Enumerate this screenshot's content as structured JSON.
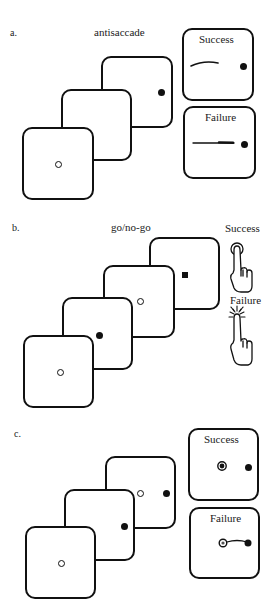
{
  "figure": {
    "panels": [
      {
        "letter": "a.",
        "title": "antisaccade",
        "trial_frames": [
          {
            "stimulus": "hollow-circle-center"
          },
          {
            "stimulus": "blank"
          },
          {
            "stimulus": "filled-dot-right"
          }
        ],
        "outcomes": {
          "success_label": "Success",
          "failure_label": "Failure",
          "success_depiction": "eye trace moves away from target (leftward curve)",
          "failure_depiction": "eye trace moves toward target dot"
        }
      },
      {
        "letter": "b.",
        "title": "go/no-go",
        "trial_frames": [
          {
            "stimulus": "hollow-circle-center"
          },
          {
            "stimulus": "filled-dot"
          },
          {
            "stimulus": "hollow-circle"
          },
          {
            "stimulus": "filled-square"
          }
        ],
        "outcomes": {
          "success_label": "Success",
          "failure_label": "Failure",
          "success_icon": "hand-pointer-hold-icon",
          "failure_icon": "hand-pointer-press-burst-icon"
        }
      },
      {
        "letter": "c.",
        "title": "",
        "trial_frames": [
          {
            "stimulus": "hollow-circle-center"
          },
          {
            "stimulus": "filled-dot-right"
          },
          {
            "stimulus": "hollow-circle-and-filled-dot"
          }
        ],
        "outcomes": {
          "success_label": "Success",
          "failure_label": "Failure",
          "success_depiction": "gaze remains on fixation ring",
          "failure_depiction": "gaze jumps from fixation to dot"
        }
      }
    ]
  }
}
